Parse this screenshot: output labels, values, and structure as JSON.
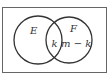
{
  "diagram": {
    "type": "venn",
    "sets": [
      {
        "name": "E",
        "label": "E"
      },
      {
        "name": "F",
        "label": "F"
      }
    ],
    "regions": {
      "intersection": "k",
      "f_only": "m − k"
    },
    "colors": {
      "stroke": "#333333",
      "frame": "#555555",
      "background": "#ffffff"
    }
  }
}
